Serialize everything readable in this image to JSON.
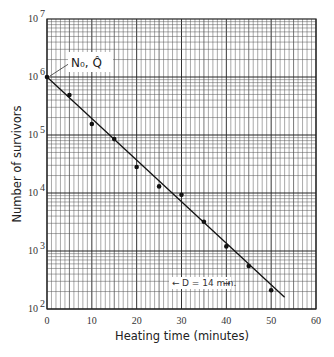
{
  "chart_data": {
    "type": "scatter",
    "title": "",
    "xlabel": "Heating time (minutes)",
    "ylabel": "Number of survivors",
    "xlim": [
      0,
      60
    ],
    "ylim": [
      100,
      10000000
    ],
    "yscale": "log",
    "grid": true,
    "x_ticks": [
      "0",
      "10",
      "20",
      "30",
      "40",
      "50",
      "60"
    ],
    "y_ticks": [
      {
        "base": "10",
        "exp": "2"
      },
      {
        "base": "10",
        "exp": "3"
      },
      {
        "base": "10",
        "exp": "4"
      },
      {
        "base": "10",
        "exp": "5"
      },
      {
        "base": "10",
        "exp": "6"
      },
      {
        "base": "10",
        "exp": "7"
      }
    ],
    "series": [
      {
        "name": "Survivors (observed)",
        "type": "scatter",
        "x": [
          0,
          5,
          10,
          15,
          20,
          25,
          30,
          35,
          40,
          45,
          50
        ],
        "y": [
          1000000,
          490000,
          155000,
          85000,
          28000,
          13000,
          9300,
          3200,
          1200,
          550,
          210
        ]
      },
      {
        "name": "Fitted survivor curve",
        "type": "line",
        "x": [
          0,
          53
        ],
        "y": [
          1000000,
          160
        ]
      }
    ],
    "annotations": [
      {
        "text": "N₀, Q̂",
        "x": 0,
        "y": 1000000,
        "note": "intercept label with leader line"
      },
      {
        "text": "D = 14 min.",
        "note": "decimal reduction time, shown with arrows spanning one log cycle"
      }
    ]
  },
  "labels": {
    "n0": "N₀, Q̂",
    "d_value": "D = 14 min."
  }
}
